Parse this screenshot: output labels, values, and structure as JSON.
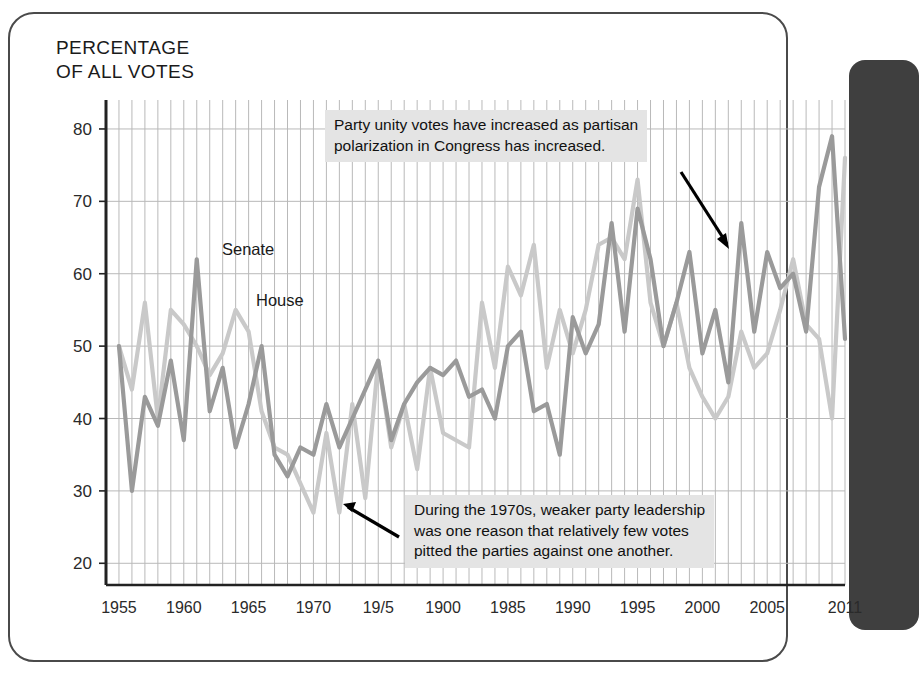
{
  "figure": {
    "title": "PERCENTAGE\nOF ALL VOTES",
    "senate_label": "Senate",
    "house_label": "House",
    "annotation_top": "Party unity votes have increased as partisan\npolarization in Congress has increased.",
    "annotation_bottom": "During the 1970s, weaker party leadership\nwas one reason that relatively few votes\npitted the parties against one another.",
    "colors": {
      "senate_line": "#9a9a9a",
      "house_line": "#c9c9c9",
      "grid": "#b9b9b9",
      "axis": "#222222",
      "annotation_background": "#e4e4e4",
      "side_panel": "#3f3f3f"
    }
  },
  "chart_data": {
    "type": "line",
    "title": "PERCENTAGE OF ALL VOTES",
    "xlabel": "",
    "ylabel": "PERCENTAGE OF ALL VOTES",
    "xlim": [
      1954,
      2011
    ],
    "ylim": [
      17,
      84
    ],
    "yticks": [
      20,
      30,
      40,
      50,
      60,
      70,
      80
    ],
    "ytick_labels": [
      "20",
      "30",
      "40",
      "50",
      "60",
      "70",
      "80"
    ],
    "xticks": [
      1955,
      1960,
      1965,
      1970,
      1975,
      1980,
      1985,
      1990,
      1995,
      2000,
      2005,
      2011
    ],
    "xtick_labels": [
      "1955",
      "1960",
      "1965",
      "1970",
      "19/5",
      "1900",
      "1985",
      "1990",
      "1995",
      "2000",
      "2005",
      "2011"
    ],
    "grid": "vertical annual gridlines, horizontal gridlines at each 10-unit tick",
    "legend": "inline labels on plot",
    "x": [
      1955,
      1956,
      1957,
      1958,
      1959,
      1960,
      1961,
      1962,
      1963,
      1964,
      1965,
      1966,
      1967,
      1968,
      1969,
      1970,
      1971,
      1972,
      1973,
      1974,
      1975,
      1976,
      1977,
      1978,
      1979,
      1980,
      1981,
      1982,
      1983,
      1984,
      1985,
      1986,
      1987,
      1988,
      1989,
      1990,
      1991,
      1992,
      1993,
      1994,
      1995,
      1996,
      1997,
      1998,
      1999,
      2000,
      2001,
      2002,
      2003,
      2004,
      2005,
      2006,
      2007,
      2008,
      2009,
      2010,
      2011
    ],
    "series": [
      {
        "name": "Senate",
        "color": "#9a9a9a",
        "values": [
          50,
          30,
          43,
          39,
          48,
          37,
          62,
          41,
          47,
          36,
          42,
          50,
          35,
          32,
          36,
          35,
          42,
          36,
          40,
          44,
          48,
          37,
          42,
          45,
          47,
          46,
          48,
          43,
          44,
          40,
          50,
          52,
          41,
          42,
          35,
          54,
          49,
          53,
          67,
          52,
          69,
          62,
          50,
          56,
          63,
          49,
          55,
          45,
          67,
          52,
          63,
          58,
          60,
          52,
          72,
          79,
          51
        ]
      },
      {
        "name": "House",
        "color": "#c9c9c9",
        "values": [
          50,
          44,
          56,
          40,
          55,
          53,
          50,
          46,
          49,
          55,
          52,
          41,
          36,
          35,
          31,
          27,
          38,
          27,
          42,
          29,
          48,
          36,
          42,
          33,
          47,
          38,
          37,
          36,
          56,
          47,
          61,
          57,
          64,
          47,
          55,
          49,
          55,
          64,
          65,
          62,
          73,
          56,
          50,
          56,
          47,
          43,
          40,
          43,
          52,
          47,
          49,
          55,
          62,
          53,
          51,
          40,
          76
        ]
      }
    ],
    "annotations": [
      {
        "text": "Party unity votes have increased as partisan polarization in Congress has increased.",
        "arrow_points_to": "Senate line near 2003"
      },
      {
        "text": "During the 1970s, weaker party leadership was one reason that relatively few votes pitted the parties against one another.",
        "arrow_points_to": "House line trough near 1972"
      }
    ]
  }
}
